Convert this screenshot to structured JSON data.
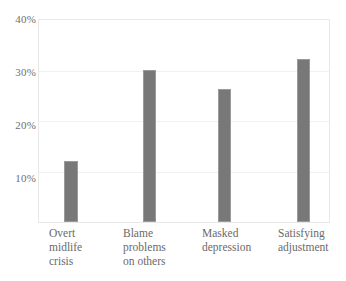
{
  "chart_data": {
    "type": "bar",
    "title": "",
    "subtitle": "",
    "xlabel": "",
    "ylabel": "",
    "categories": [
      "Overt\nmidlife\ncrisis",
      "Blame\nproblems\non others",
      "Masked\ndepression",
      "Satisfying\nadjustment"
    ],
    "values": [
      12.0,
      30.2,
      26.3,
      32.2
    ],
    "ylim": [
      0,
      40
    ],
    "yticks": [
      10,
      20,
      30,
      40
    ],
    "ytick_labels": [
      "10%",
      "20%",
      "30%",
      "40%"
    ],
    "grid": true,
    "grid_axis": "y",
    "legend": "none",
    "bar_color": "#787878",
    "bar_edge_color": "#9a9a9a",
    "grid_color": "#f1f1f1",
    "frame_color": "#e8e8e8",
    "tick_label_color": "#6f6f6f",
    "category_label_color": "#6a6a6a",
    "background_color": "#ffffff"
  }
}
